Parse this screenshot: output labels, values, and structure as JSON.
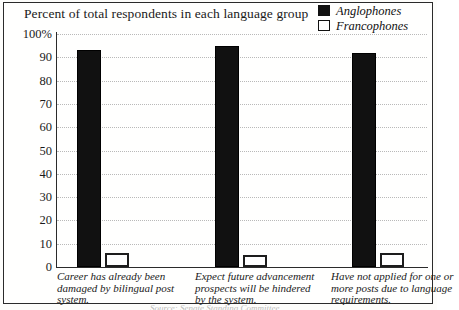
{
  "chart_data": {
    "type": "bar",
    "title": "Percent of total respondents in each language group",
    "xlabel": "",
    "ylabel": "",
    "ylim": [
      0,
      100
    ],
    "yticks": [
      "100%",
      "90",
      "80",
      "70",
      "60",
      "50",
      "40",
      "30",
      "20",
      "10",
      "0"
    ],
    "ytick_values": [
      100,
      90,
      80,
      70,
      60,
      50,
      40,
      30,
      20,
      10,
      0
    ],
    "grid": true,
    "legend_position": "top-right",
    "categories": [
      "Career has already been damaged by bilingual post system.",
      "Expect future advancement prospects will be hindered by the system.",
      "Have not applied for one or more posts due to language requirements."
    ],
    "series": [
      {
        "name": "Anglophones",
        "values": [
          93,
          95,
          92
        ],
        "color": "#111111",
        "style": "filled"
      },
      {
        "name": "Francophones",
        "values": [
          6,
          5,
          6
        ],
        "color": "#ffffff",
        "style": "hollow"
      }
    ]
  },
  "legend": {
    "items": [
      {
        "label": "Anglophones",
        "swatch": "filled-square-icon"
      },
      {
        "label": "Francophones",
        "swatch": "hollow-square-icon"
      }
    ]
  },
  "footer": {
    "source_fragment": "Source: Senate Standing Committee"
  }
}
